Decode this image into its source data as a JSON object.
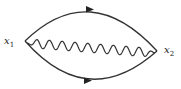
{
  "diagram": {
    "type": "feynman",
    "vertices": [
      {
        "id": "x1",
        "label": "x",
        "subscript": "1"
      },
      {
        "id": "x2",
        "label": "x",
        "subscript": "2"
      }
    ],
    "edges": [
      {
        "id": "upper-fermion",
        "kind": "fermion",
        "from": "x1",
        "to": "x2",
        "arrow": "forward"
      },
      {
        "id": "lower-fermion",
        "kind": "fermion",
        "from": "x1",
        "to": "x2",
        "arrow": "forward"
      },
      {
        "id": "photon",
        "kind": "photon",
        "from": "x1",
        "to": "x2",
        "wave_peaks": 10
      }
    ],
    "colors": {
      "line": "#333333",
      "background": "#ffffff"
    }
  }
}
